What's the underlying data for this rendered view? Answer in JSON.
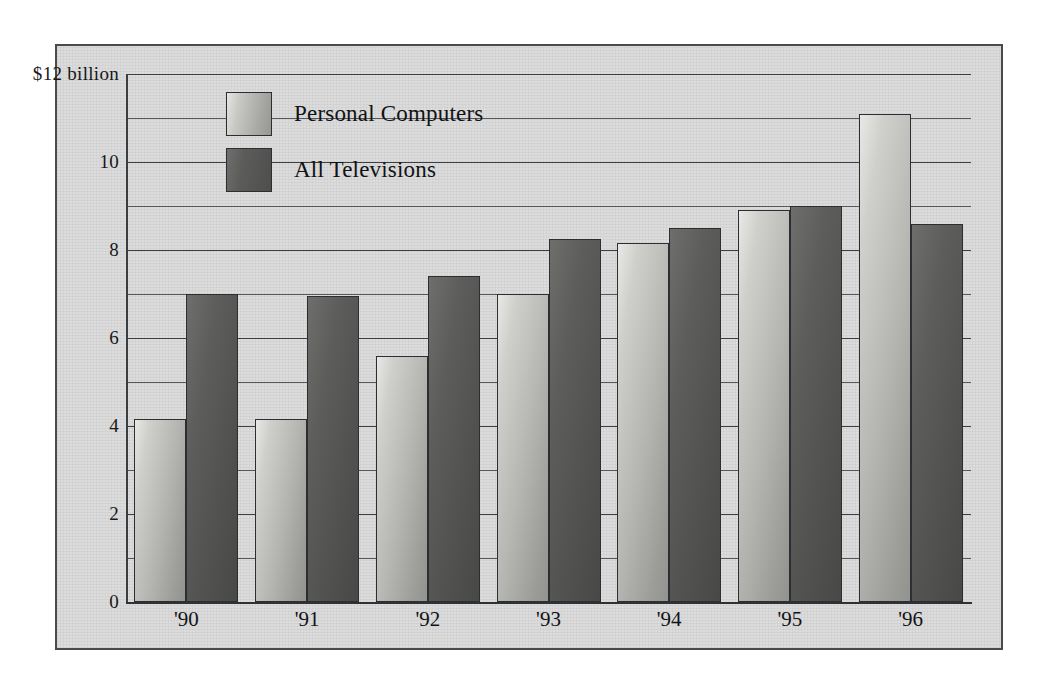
{
  "chart_data": {
    "type": "bar",
    "title": "",
    "subtitle": "",
    "xlabel": "",
    "ylabel": "",
    "ylim": [
      0,
      12
    ],
    "y_unit_label": "$12 billion",
    "y_ticks": [
      "0",
      "2",
      "4",
      "6",
      "8",
      "10",
      "$12 billion"
    ],
    "y_tick_values": [
      0,
      2,
      4,
      6,
      8,
      10,
      12
    ],
    "y_gridline_step": 1,
    "grid": true,
    "legend_position": "inside-top-left",
    "categories": [
      "'90",
      "'91",
      "'92",
      "'93",
      "'94",
      "'95",
      "'96"
    ],
    "series": [
      {
        "name": "Personal Computers",
        "color": "#b4b4b0",
        "values": [
          4.15,
          4.15,
          5.6,
          7.0,
          8.15,
          8.9,
          11.1
        ]
      },
      {
        "name": "All Televisions",
        "color": "#525250",
        "values": [
          7.0,
          6.95,
          7.4,
          8.25,
          8.5,
          9.0,
          8.6
        ]
      }
    ]
  },
  "legend": {
    "items": [
      {
        "label": "Personal Computers",
        "key": "pc"
      },
      {
        "label": "All Televisions",
        "key": "tv"
      }
    ]
  },
  "colors": {
    "plate_background": "#dcdcdc",
    "frame_border": "#4a4a4a",
    "axis": "#2f3234",
    "gridline": "#55585a",
    "text": "#111316",
    "pc_bar": "#b4b4b0",
    "tv_bar": "#525250"
  }
}
